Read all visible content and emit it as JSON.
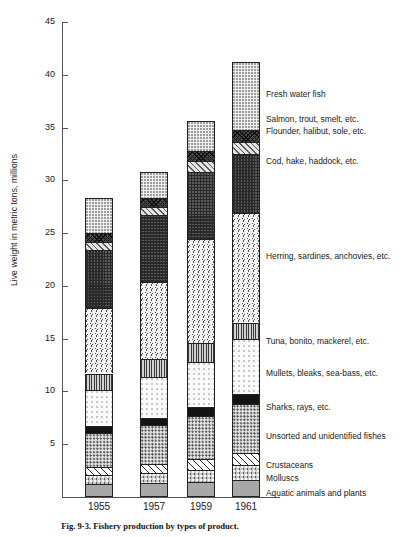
{
  "figure": {
    "caption": "Fig. 9-3.  Fishery production by types of product."
  },
  "chart_data": {
    "type": "bar",
    "subtype": "stacked-bar",
    "title": "Fishery production by types of product",
    "xlabel": "",
    "ylabel": "Live weight in metric tons, millions",
    "ylim": [
      0,
      45
    ],
    "ytick_step": 5,
    "yticks": [
      "45",
      "40",
      "35",
      "30",
      "25",
      "20",
      "15",
      "10",
      "5"
    ],
    "grid": false,
    "legend_position": "right-inline",
    "categories": [
      "1955",
      "1957",
      "1959",
      "1961"
    ],
    "totals": [
      28.3,
      30.8,
      35.6,
      41.2
    ],
    "series": [
      {
        "name": "Aquatic animals and plants",
        "pattern": "p-aquatic",
        "values": [
          1.2,
          1.3,
          1.4,
          1.6
        ]
      },
      {
        "name": "Molluscs",
        "pattern": "p-molluscs",
        "values": [
          0.9,
          1.0,
          1.2,
          1.4
        ]
      },
      {
        "name": "Crustaceans",
        "pattern": "p-crustaceans",
        "values": [
          0.7,
          0.8,
          1.0,
          1.2
        ]
      },
      {
        "name": "Unsorted and unidentified fishes",
        "pattern": "p-unsorted",
        "values": [
          3.3,
          3.7,
          4.1,
          4.6
        ]
      },
      {
        "name": "Sharks, rays, etc.",
        "pattern": "p-sharks",
        "values": [
          0.6,
          0.7,
          0.8,
          1.0
        ]
      },
      {
        "name": "Mullets, bleaks, sea-bass, etc.",
        "pattern": "p-mullets",
        "values": [
          3.4,
          3.9,
          4.3,
          5.2
        ]
      },
      {
        "name": "Tuna, bonito, mackerel, etc.",
        "pattern": "p-tuna",
        "values": [
          1.6,
          1.7,
          1.8,
          1.5
        ]
      },
      {
        "name": "Herring, sardines, anchovies, etc.",
        "pattern": "p-herring",
        "values": [
          6.2,
          7.3,
          9.8,
          10.4
        ]
      },
      {
        "name": "Cod, hake, haddock, etc.",
        "pattern": "p-cod",
        "values": [
          5.5,
          6.3,
          6.4,
          5.6
        ]
      },
      {
        "name": "Flounder, halibut, sole, etc.",
        "pattern": "p-flounder",
        "values": [
          0.8,
          0.8,
          1.0,
          1.1
        ]
      },
      {
        "name": "Salmon, trout, smelt, etc.",
        "pattern": "p-salmon",
        "values": [
          0.8,
          0.8,
          1.0,
          1.2
        ]
      },
      {
        "name": "Fresh water fish",
        "pattern": "p-fresh",
        "values": [
          3.3,
          2.5,
          2.8,
          6.4
        ]
      }
    ],
    "legend_targets": [
      {
        "name": "Fresh water fish",
        "y": 90
      },
      {
        "name": "Salmon, trout, smelt, etc.",
        "y": 115
      },
      {
        "name": "Flounder, halibut, sole, etc.",
        "y": 127
      },
      {
        "name": "Cod, hake, haddock, etc.",
        "y": 157
      },
      {
        "name": "Herring, sardines, anchovies, etc.",
        "y": 252
      },
      {
        "name": "Tuna, bonito, mackerel, etc.",
        "y": 337
      },
      {
        "name": "Mullets, bleaks, sea-bass, etc.",
        "y": 369
      },
      {
        "name": "Sharks, rays, etc.",
        "y": 403
      },
      {
        "name": "Unsorted and unidentified fishes",
        "y": 432
      },
      {
        "name": "Crustaceans",
        "y": 461
      },
      {
        "name": "Molluscs",
        "y": 474
      },
      {
        "name": "Aquatic animals and plants",
        "y": 489
      }
    ]
  }
}
